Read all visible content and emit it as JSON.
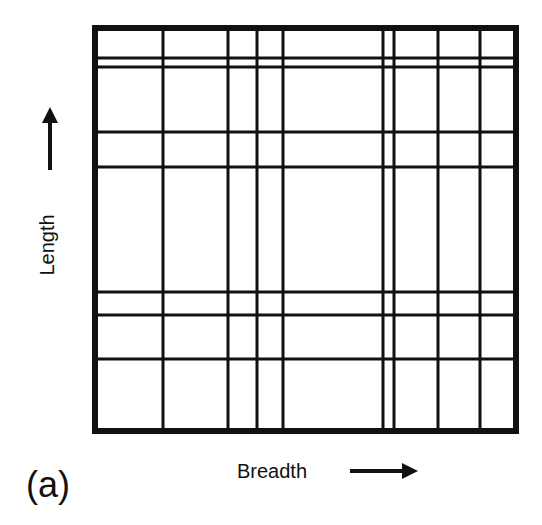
{
  "figure": {
    "panel_label": "(a)",
    "x_axis_label": "Breadth",
    "y_axis_label": "Length",
    "line_color": "#111111",
    "background": "#ffffff"
  },
  "grid": {
    "frame": {
      "left": 95,
      "top": 28,
      "right": 516,
      "bottom": 431,
      "stroke_width": 6
    },
    "vertical_lines_x": [
      163,
      228,
      257,
      283,
      383,
      394,
      438,
      480
    ],
    "horizontal_lines_y": [
      58,
      67,
      132,
      167,
      292,
      315,
      359
    ],
    "line_width": 3
  },
  "arrows": {
    "length_arrow": {
      "x": 50,
      "y_from": 170,
      "y_to": 105,
      "direction": "up"
    },
    "breadth_arrow": {
      "y": 471,
      "x_from": 350,
      "x_to": 420,
      "direction": "right"
    }
  }
}
